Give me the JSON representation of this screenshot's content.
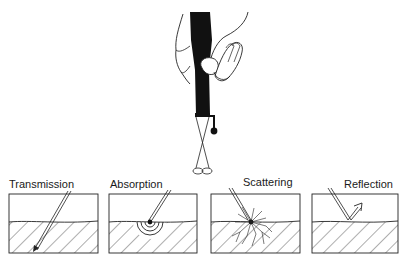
{
  "figure": {
    "panels": [
      {
        "id": "transmission",
        "label": "Transmission"
      },
      {
        "id": "absorption",
        "label": "Absorption"
      },
      {
        "id": "scattering",
        "label": "Scattering"
      },
      {
        "id": "reflection",
        "label": "Reflection"
      }
    ]
  },
  "colors": {
    "ink": "#1a1a1a",
    "background": "#ffffff"
  }
}
